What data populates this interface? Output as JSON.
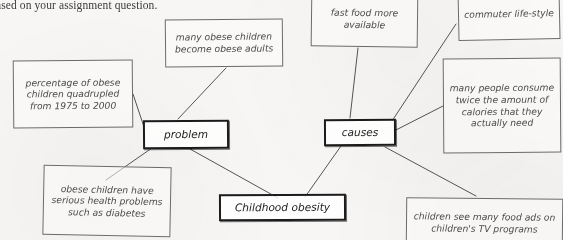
{
  "document": {
    "partial_header_text": "ased on your assignment question."
  },
  "diagram": {
    "style": {
      "page_color": "#f7f6f4",
      "ink_color": "#4a4a4a",
      "key_node_color": "#1b1b1b"
    },
    "nodes": [
      {
        "id": "core",
        "label": "Childhood obesity",
        "emphasis": "key"
      },
      {
        "id": "problem",
        "label": "problem",
        "emphasis": "key"
      },
      {
        "id": "causes",
        "label": "causes",
        "emphasis": "key"
      },
      {
        "id": "stat",
        "label": "percentage of obese children quadrupled from 1975 to 2000",
        "emphasis": "normal"
      },
      {
        "id": "adults",
        "label": "many obese children become obese adults",
        "emphasis": "normal"
      },
      {
        "id": "health",
        "label": "obese children have serious health problems such as diabetes",
        "emphasis": "normal"
      },
      {
        "id": "fastfood",
        "label": "fast food more available",
        "emphasis": "normal"
      },
      {
        "id": "commuter",
        "label": "commuter life-style",
        "emphasis": "normal"
      },
      {
        "id": "calories",
        "label": "many people consume twice the amount of calories that they actually need",
        "emphasis": "normal"
      },
      {
        "id": "ads",
        "label": "children see many food ads on children's TV programs",
        "emphasis": "normal"
      }
    ],
    "edges": [
      {
        "from": "core",
        "to": "problem"
      },
      {
        "from": "core",
        "to": "causes"
      },
      {
        "from": "problem",
        "to": "stat"
      },
      {
        "from": "problem",
        "to": "adults"
      },
      {
        "from": "problem",
        "to": "health"
      },
      {
        "from": "causes",
        "to": "fastfood"
      },
      {
        "from": "causes",
        "to": "commuter"
      },
      {
        "from": "causes",
        "to": "calories"
      },
      {
        "from": "causes",
        "to": "ads"
      }
    ]
  }
}
